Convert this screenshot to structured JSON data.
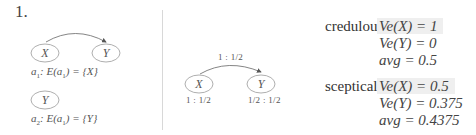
{
  "item_number": "1.",
  "left_panel": {
    "graph1": {
      "nodes": [
        "X",
        "Y"
      ],
      "edge": {
        "from": "X",
        "to": "Y"
      },
      "caption_var": "a",
      "caption_sub": "1",
      "caption_text": ": E(a",
      "caption_text_sub": "1",
      "caption_text_end": ") = {X}"
    },
    "graph2": {
      "nodes": [
        "Y"
      ],
      "caption_var": "a",
      "caption_sub": "2",
      "caption_text": ": E(a",
      "caption_text_sub": "1",
      "caption_text_end": ") = {Y}"
    }
  },
  "middle_panel": {
    "nodes": [
      "X",
      "Y"
    ],
    "edge_label": "1 : 1/2",
    "node_x_label": "1 : 1/2",
    "node_y_label": "1/2 : 1/2"
  },
  "right_panel": {
    "credulous": {
      "label": "credulous",
      "lines": [
        "Ve(X) = 1",
        "Ve(Y) = 0",
        "avg = 0.5"
      ],
      "highlight_first": true
    },
    "sceptical": {
      "label": "sceptical",
      "lines": [
        "Ve(X) = 0.5",
        "Ve(Y) = 0.375",
        "avg = 0.4375"
      ],
      "highlight_first": true
    }
  },
  "colors": {
    "node_stroke": "#888888",
    "divider": "#d8d8d8",
    "highlight": "#efefef"
  }
}
